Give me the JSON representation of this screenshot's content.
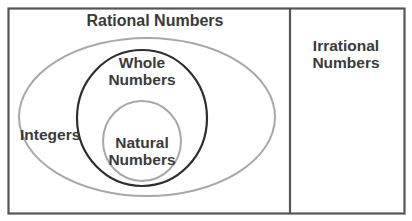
{
  "diagram": {
    "type": "venn",
    "regions": {
      "rational": {
        "label": "Rational Numbers"
      },
      "irrational": {
        "label": "Irrational Numbers",
        "line1": "Irrational",
        "line2": "Numbers"
      },
      "integers": {
        "label": "Integers"
      },
      "whole": {
        "label": "Whole Numbers",
        "line1": "Whole",
        "line2": "Numbers"
      },
      "natural": {
        "label": "Natural Numbers",
        "line1": "Natural",
        "line2": "Numbers"
      }
    },
    "colors": {
      "frame": "#555555",
      "integers_ellipse": "#a8a8a8",
      "whole_circle": "#2e2e2e",
      "natural_circle": "#a8a8a8",
      "text": "#3a3a3a"
    }
  }
}
